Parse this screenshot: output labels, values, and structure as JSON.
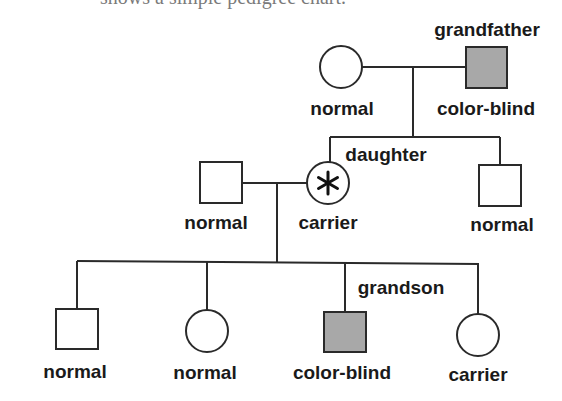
{
  "caption": "shows a simple pedigree chart.",
  "colors": {
    "line": "#2a2a2a",
    "affected_fill": "#a8a8a8",
    "unaffected_fill": "#ffffff",
    "text": "#1a1a1a"
  },
  "legend_meaning": {
    "square": "male",
    "circle": "female",
    "shaded": "color-blind",
    "asterisk": "carrier"
  },
  "generations": [
    {
      "name": "grandparents",
      "members": [
        {
          "id": "grandmother",
          "sex": "female",
          "status": "normal",
          "label": "normal",
          "role_label": ""
        },
        {
          "id": "grandfather",
          "sex": "male",
          "status": "color-blind",
          "label": "color-blind",
          "role_label": "grandfather"
        }
      ]
    },
    {
      "name": "parents",
      "members": [
        {
          "id": "father",
          "sex": "male",
          "status": "normal",
          "label": "normal",
          "role_label": ""
        },
        {
          "id": "daughter",
          "sex": "female",
          "status": "carrier",
          "label": "carrier",
          "role_label": "daughter"
        },
        {
          "id": "son",
          "sex": "male",
          "status": "normal",
          "label": "normal",
          "role_label": ""
        }
      ]
    },
    {
      "name": "grandchildren",
      "members": [
        {
          "id": "grandchild-1",
          "sex": "male",
          "status": "normal",
          "label": "normal",
          "role_label": ""
        },
        {
          "id": "grandchild-2",
          "sex": "female",
          "status": "normal",
          "label": "normal",
          "role_label": ""
        },
        {
          "id": "grandson",
          "sex": "male",
          "status": "color-blind",
          "label": "color-blind",
          "role_label": "grandson"
        },
        {
          "id": "grandchild-4",
          "sex": "female",
          "status": "carrier",
          "label": "carrier",
          "role_label": ""
        }
      ]
    }
  ]
}
